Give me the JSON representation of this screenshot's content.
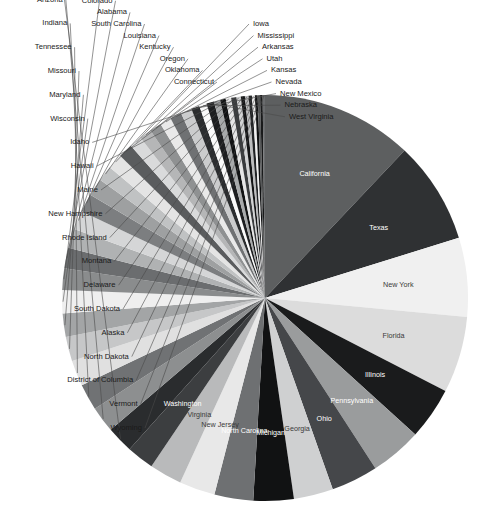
{
  "chart_data": {
    "type": "pie",
    "title": "",
    "subtitle": "",
    "xlabel": "",
    "ylabel": "",
    "legend_position": "none",
    "grid": false,
    "label_mode": "slice labels; large slices labelled inside, small slices labelled outside with leader lines",
    "sort_order": "descending, clockwise starting at 12 o'clock",
    "categories": [
      "California",
      "Texas",
      "New York",
      "Florida",
      "Illinois",
      "Pennsylvania",
      "Ohio",
      "Georgia",
      "Michigan",
      "North Carolina",
      "New Jersey",
      "Virginia",
      "Washington",
      "Massachusetts",
      "Arizona",
      "Indiana",
      "Tennessee",
      "Missouri",
      "Maryland",
      "Wisconsin",
      "Minnesota",
      "Colorado",
      "Alabama",
      "South Carolina",
      "Louisiana",
      "Kentucky",
      "Oregon",
      "Oklahoma",
      "Connecticut",
      "Iowa",
      "Mississippi",
      "Arkansas",
      "Utah",
      "Kansas",
      "Nevada",
      "New Mexico",
      "Nebraska",
      "West Virginia",
      "Idaho",
      "Hawaii",
      "Maine",
      "New Hampshire",
      "Rhode Island",
      "Montana",
      "Delaware",
      "South Dakota",
      "Alaska",
      "North Dakota",
      "District of Columbia",
      "Vermont",
      "Wyoming"
    ],
    "values": [
      37254,
      25146,
      19378,
      18801,
      12831,
      12702,
      11537,
      9688,
      9884,
      9535,
      8792,
      8001,
      6725,
      6548,
      6392,
      6484,
      6346,
      5989,
      5774,
      5687,
      5304,
      5029,
      4780,
      4625,
      4533,
      4339,
      3831,
      3751,
      3574,
      3046,
      2967,
      2916,
      2764,
      2853,
      2701,
      2059,
      1826,
      1853,
      1568,
      1360,
      1328,
      1316,
      1053,
      989,
      898,
      814,
      710,
      673,
      602,
      626,
      564
    ],
    "unit": "thousands of people",
    "slice_colors": [
      "#5d5f60",
      "#2f3133",
      "#f0f0f0",
      "#dcdcdc",
      "#1a1b1c",
      "#9a9c9d",
      "#45474a",
      "#cfd0d1",
      "#111213",
      "#6e7072",
      "#e8e8e8",
      "#b9babb",
      "#3c3e40",
      "#2a2c2e",
      "#8d8f90",
      "#707274",
      "#e0e0e0",
      "#c6c7c8",
      "#a3a5a6",
      "#efefef",
      "#8a8c8d",
      "#6b6d6f",
      "#b0b2b3",
      "#d5d6d7",
      "#7c7e80",
      "#9ea0a1",
      "#c0c2c3",
      "#e4e4e4",
      "#5a5c5e",
      "#d9dadb",
      "#b5b6b7",
      "#8f9192",
      "#e9e9e9",
      "#6f7173",
      "#cbcccd",
      "#2b2d2f",
      "#fafafa",
      "#1d1e20",
      "#a8aaab",
      "#121314",
      "#e6e6e6",
      "#3a3c3e",
      "#d2d3d4",
      "#141516",
      "#bcbdbe",
      "#202224",
      "#efefef",
      "#0f1011",
      "#565859",
      "#191a1b",
      "#6a6c6e"
    ],
    "inner_labelled": [
      "California",
      "Texas",
      "New York",
      "Florida",
      "Illinois",
      "Pennsylvania",
      "Ohio",
      "Georgia",
      "Michigan",
      "North Carolina",
      "New Jersey",
      "Virginia",
      "Washington"
    ],
    "outer_labelled": [
      "Massachusetts",
      "Arizona",
      "Indiana",
      "Tennessee",
      "Missouri",
      "Maryland",
      "Wisconsin",
      "Minnesota",
      "Colorado",
      "Alabama",
      "South Carolina",
      "Louisiana",
      "Kentucky",
      "Oregon",
      "Oklahoma",
      "Connecticut",
      "Iowa",
      "Mississippi",
      "Arkansas",
      "Utah",
      "Kansas",
      "Nevada",
      "New Mexico",
      "Nebraska",
      "West Virginia",
      "Idaho",
      "Hawaii",
      "Maine",
      "New Hampshire",
      "Rhode Island",
      "Montana",
      "Delaware",
      "South Dakota",
      "Alaska",
      "North Dakota",
      "District of Columbia",
      "Vermont",
      "Wyoming"
    ]
  },
  "geometry": {
    "center_x": 265,
    "center_y": 298,
    "radius": 203,
    "start_angle_deg": -90
  }
}
